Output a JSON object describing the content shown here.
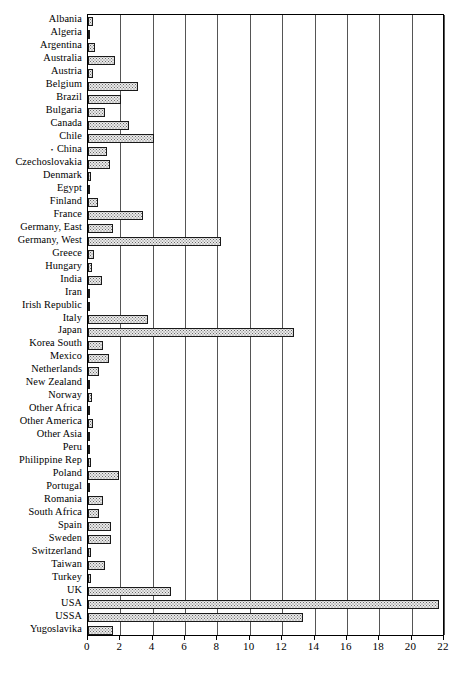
{
  "chart_data": {
    "type": "bar",
    "orientation": "horizontal",
    "title": "",
    "xlabel": "",
    "ylabel": "",
    "xlim": [
      0,
      22
    ],
    "xticks": [
      0,
      2,
      4,
      6,
      8,
      10,
      12,
      14,
      16,
      18,
      20,
      22
    ],
    "grid": "vertical-gridlines-at-xticks",
    "legend": "none",
    "categories": [
      "Albania",
      "Algeria",
      "Argentina",
      "Australia",
      "Austria",
      "Belgium",
      "Brazil",
      "Bulgaria",
      "Canada",
      "Chile",
      "China",
      "Czechoslovakia",
      "Denmark",
      "Egypt",
      "Finland",
      "France",
      "Germany, East",
      "Germany, West",
      "Greece",
      "Hungary",
      "India",
      "Iran",
      "Irish Republic",
      "Italy",
      "Japan",
      "Korea  South",
      "Mexico",
      "Netherlands",
      "New Zealand",
      "Norway",
      "Other Africa",
      "Other America",
      "Other Asia",
      "Peru",
      "Philippine Rep",
      "Poland",
      "Portugal",
      "Romania",
      "South Africa",
      "Spain",
      "Sweden",
      "Switzerland",
      "Taiwan",
      "Turkey",
      "UK",
      "USA",
      "USSA",
      "Yugoslavika"
    ],
    "category_markers": {
      "China": "•"
    },
    "values": [
      0.3,
      0.12,
      0.45,
      1.65,
      0.3,
      3.1,
      2.05,
      1.05,
      2.55,
      4.05,
      1.2,
      1.35,
      0.18,
      0.05,
      0.6,
      3.4,
      1.55,
      8.2,
      0.35,
      0.25,
      0.85,
      0.12,
      0.1,
      3.7,
      12.7,
      0.95,
      1.3,
      0.65,
      0.05,
      0.25,
      0.05,
      0.3,
      0.05,
      0.08,
      0.2,
      1.9,
      0.15,
      0.9,
      0.7,
      1.45,
      1.4,
      0.2,
      1.05,
      0.18,
      5.1,
      21.7,
      13.3,
      1.55
    ]
  }
}
